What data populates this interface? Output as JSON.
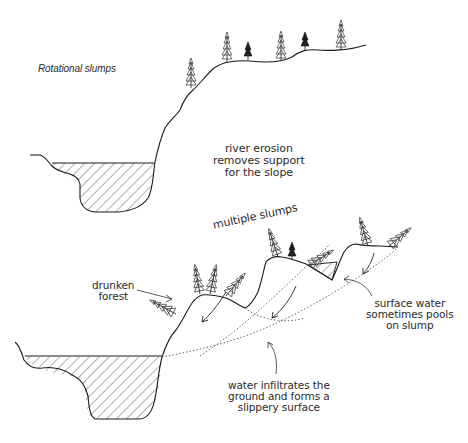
{
  "diagram": {
    "title": "Rotational slumps",
    "top_panel": {
      "caption": [
        "river erosion",
        "removes support",
        "for the slope"
      ]
    },
    "bottom_panel": {
      "heading": "multiple slumps",
      "labels": {
        "drunken_forest": [
          "drunken",
          "forest"
        ],
        "surface_water": [
          "surface water",
          "sometimes pools",
          "on slump"
        ],
        "water_infiltrates": [
          "water infiltrates the",
          "ground and forms a",
          "slippery surface"
        ]
      }
    },
    "colors": {
      "line": "#1a1a1a",
      "text": "#2a2a2a",
      "background": "#ffffff"
    }
  }
}
